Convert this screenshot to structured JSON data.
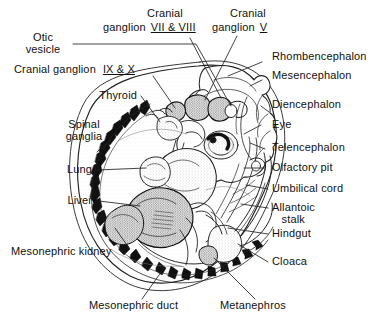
{
  "figure": {
    "background_color": "#ffffff",
    "ink_color": "#111111",
    "line_color": "#222222"
  },
  "labels": {
    "otic_vesicle": "Otic\nvesicle",
    "cranial_ganglion_7_8_line1": "Cranial",
    "cranial_ganglion_7_8_line2": "ganglion",
    "cranial_ganglion_7_8_roman": "VII & VIII",
    "cranial_ganglion_5_line1": "Cranial",
    "cranial_ganglion_5_line2": "ganglion",
    "cranial_ganglion_5_roman": "V",
    "cranial_ganglion_9_10_text": "Cranial ganglion",
    "cranial_ganglion_9_10_roman": "IX & X",
    "thyroid": "Thyroid",
    "spinal_ganglia": "Spinal\nganglia",
    "lung": "Lung",
    "liver": "Liver",
    "mesonephric_kidney": "Mesonephric kidney",
    "mesonephric_duct": "Mesonephric duct",
    "metanephros": "Metanephros",
    "rhombencephalon": "Rhombencephalon",
    "mesencephalon": "Mesencephalon",
    "diencephalon": "Diencephalon",
    "eye": "Eye",
    "telencephalon": "Telencephalon",
    "olfactory_pit": "Olfactory pit",
    "umbilical_cord": "Umbilical cord",
    "allantoic_stalk": "Allantoic\n   stalk",
    "hindgut": "Hindgut",
    "cloaca": "Cloaca"
  },
  "structures": {
    "brain_vesicles": [
      "Rhombencephalon",
      "Mesencephalon",
      "Diencephalon",
      "Telencephalon"
    ],
    "sense_organs": [
      "Otic vesicle",
      "Eye",
      "Olfactory pit"
    ],
    "cranial_ganglia": [
      "V",
      "VII & VIII",
      "IX & X"
    ],
    "viscera": [
      "Thyroid",
      "Lung",
      "Liver",
      "Hindgut",
      "Cloaca"
    ],
    "urogenital": [
      "Mesonephric kidney",
      "Mesonephric duct",
      "Metanephros"
    ],
    "extraembryonic": [
      "Umbilical cord",
      "Allantoic stalk"
    ],
    "neural": [
      "Spinal ganglia"
    ]
  }
}
